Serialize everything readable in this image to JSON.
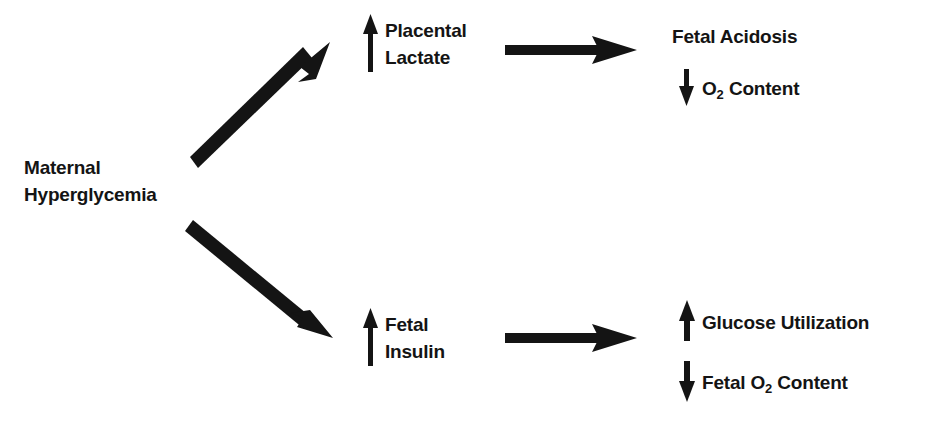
{
  "diagram": {
    "background_color": "#ffffff",
    "ink_color": "#141414",
    "nodes": {
      "source": {
        "line1": "Maternal",
        "line2": "Hyperglycemia"
      },
      "placental_lactate": {
        "line1": "Placental",
        "line2": "Lactate",
        "direction": "up"
      },
      "fetal_insulin": {
        "line1": "Fetal",
        "line2": "Insulin",
        "direction": "up"
      },
      "fetal_acidosis": {
        "line1": "Fetal Acidosis"
      },
      "o2_content": {
        "prefix": "O",
        "subscript": "2",
        "suffix": " Content",
        "direction": "down"
      },
      "glucose_utilization": {
        "line1": "Glucose Utilization",
        "direction": "up"
      },
      "fetal_o2_content": {
        "prefix": "Fetal O",
        "subscript": "2",
        "suffix": " Content",
        "direction": "down"
      }
    },
    "connectors": [
      {
        "name": "source-to-placental-lactate",
        "kind": "diagonal-up-right",
        "from": "source",
        "to": "placental_lactate"
      },
      {
        "name": "source-to-fetal-insulin",
        "kind": "diagonal-down-right",
        "from": "source",
        "to": "fetal_insulin"
      },
      {
        "name": "placental-lactate-to-fetal-acidosis",
        "kind": "horizontal-right",
        "from": "placental_lactate",
        "to": "fetal_acidosis"
      },
      {
        "name": "fetal-insulin-to-glucose-utilization",
        "kind": "horizontal-right",
        "from": "fetal_insulin",
        "to": "glucose_utilization"
      }
    ]
  }
}
